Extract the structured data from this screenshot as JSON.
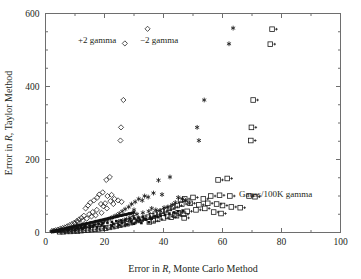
{
  "chart_data": {
    "type": "scatter",
    "title": "",
    "xlabel": "Error in R, Monte Carlo Method",
    "ylabel": "Error in R, Taylor Method",
    "xlabel_parts": {
      "pre": "Error in ",
      "italic": "R",
      "post": ", Monte Carlo Method"
    },
    "ylabel_parts": {
      "pre": "Error in ",
      "italic": "R",
      "post": ", Taylor Method"
    },
    "xlim": [
      0,
      100
    ],
    "ylim": [
      0,
      600
    ],
    "xticks": [
      0,
      20,
      40,
      60,
      80,
      100
    ],
    "yticks": [
      0,
      200,
      400,
      600
    ],
    "xticklabels": [
      "0",
      "20",
      "40",
      "60",
      "80",
      "100"
    ],
    "yticklabels": [
      "0",
      "200",
      "400",
      "600"
    ],
    "x_minor_step": 10,
    "y_minor_step": 50,
    "grid": false,
    "legend_position": "in-plot annotations",
    "annotations": [
      {
        "text": "+2 gamma",
        "x": 17.5,
        "y": 520,
        "marker": "diamond"
      },
      {
        "text": "−2 gamma",
        "x": 38.5,
        "y": 520,
        "marker": "asterisk"
      },
      {
        "text": "Gauss/100K gamma",
        "x": 78,
        "y": 97,
        "marker": "square-plus"
      }
    ],
    "series": [
      {
        "name": "+2 gamma",
        "marker": "diamond",
        "points": [
          [
            34.6,
            558
          ],
          [
            26.9,
            518
          ],
          [
            26.4,
            363
          ],
          [
            25.6,
            288
          ],
          [
            25.4,
            252
          ],
          [
            21.8,
            152
          ],
          [
            20.6,
            144
          ],
          [
            19.4,
            110
          ],
          [
            18.2,
            104
          ],
          [
            17.6,
            96
          ],
          [
            21.0,
            100
          ],
          [
            22.4,
            103
          ],
          [
            16.4,
            88
          ],
          [
            15.2,
            82
          ],
          [
            14.4,
            74
          ],
          [
            13.6,
            66
          ],
          [
            19.6,
            72
          ],
          [
            17.4,
            62
          ],
          [
            16.0,
            56
          ],
          [
            14.8,
            50
          ],
          [
            23.4,
            92
          ],
          [
            24.6,
            88
          ],
          [
            25.8,
            84
          ],
          [
            20.2,
            80
          ],
          [
            18.8,
            78
          ],
          [
            13.0,
            46
          ],
          [
            12.2,
            40
          ],
          [
            11.4,
            36
          ],
          [
            10.6,
            31
          ],
          [
            9.8,
            27
          ],
          [
            9.0,
            23
          ],
          [
            8.2,
            20
          ],
          [
            7.4,
            17
          ],
          [
            6.6,
            14
          ],
          [
            5.8,
            12
          ],
          [
            5.0,
            10
          ],
          [
            4.2,
            8
          ],
          [
            3.4,
            6
          ],
          [
            2.8,
            5
          ],
          [
            2.2,
            4
          ],
          [
            22.0,
            86
          ],
          [
            23.0,
            78
          ],
          [
            20.8,
            66
          ],
          [
            19.0,
            54
          ],
          [
            17.0,
            47
          ],
          [
            15.6,
            44
          ],
          [
            14.0,
            38
          ],
          [
            12.6,
            33
          ],
          [
            11.0,
            29
          ],
          [
            10.0,
            25
          ]
        ]
      },
      {
        "name": "−2 gamma",
        "marker": "asterisk",
        "points": [
          [
            63.6,
            560
          ],
          [
            62.2,
            517
          ],
          [
            53.8,
            363
          ],
          [
            51.4,
            288
          ],
          [
            52.0,
            252
          ],
          [
            38.3,
            143
          ],
          [
            42.2,
            152
          ],
          [
            36.6,
            108
          ],
          [
            39.5,
            104
          ],
          [
            33.6,
            100
          ],
          [
            34.8,
            97
          ],
          [
            31.6,
            92
          ],
          [
            32.8,
            88
          ],
          [
            30.4,
            84
          ],
          [
            29.2,
            78
          ],
          [
            45.0,
            96
          ],
          [
            46.4,
            92
          ],
          [
            44.0,
            82
          ],
          [
            43.0,
            76
          ],
          [
            41.5,
            70
          ],
          [
            28.2,
            70
          ],
          [
            27.0,
            64
          ],
          [
            26.0,
            58
          ],
          [
            25.0,
            52
          ],
          [
            24.0,
            47
          ],
          [
            36.0,
            66
          ],
          [
            37.4,
            62
          ],
          [
            35.0,
            58
          ],
          [
            33.0,
            54
          ],
          [
            31.0,
            50
          ],
          [
            23.0,
            43
          ],
          [
            22.0,
            39
          ],
          [
            21.0,
            35
          ],
          [
            20.0,
            31
          ],
          [
            19.0,
            28
          ],
          [
            18.0,
            25
          ],
          [
            17.0,
            22
          ],
          [
            16.0,
            19
          ],
          [
            15.0,
            17
          ],
          [
            14.0,
            15
          ],
          [
            13.0,
            13
          ],
          [
            12.0,
            11
          ],
          [
            11.0,
            9
          ],
          [
            10.0,
            8
          ],
          [
            9.0,
            7
          ],
          [
            8.0,
            6
          ],
          [
            7.0,
            5
          ],
          [
            6.0,
            4
          ],
          [
            5.0,
            3
          ],
          [
            4.0,
            3
          ],
          [
            29.8,
            45
          ],
          [
            28.6,
            41
          ],
          [
            27.4,
            37
          ],
          [
            26.2,
            33
          ],
          [
            24.8,
            30
          ],
          [
            47.5,
            88
          ],
          [
            48.8,
            80
          ],
          [
            40.2,
            68
          ],
          [
            38.8,
            60
          ],
          [
            30.0,
            62
          ]
        ]
      },
      {
        "name": "Gauss/100K gamma",
        "marker": "square-plus",
        "points": [
          [
            76.8,
            557
          ],
          [
            76.2,
            516
          ],
          [
            70.4,
            363
          ],
          [
            69.8,
            288
          ],
          [
            69.6,
            252
          ],
          [
            58.5,
            144
          ],
          [
            61.6,
            148
          ],
          [
            56.0,
            100
          ],
          [
            59.0,
            102
          ],
          [
            62.5,
            100
          ],
          [
            69.0,
            100
          ],
          [
            71.0,
            98
          ],
          [
            53.5,
            92
          ],
          [
            50.0,
            96
          ],
          [
            47.2,
            92
          ],
          [
            45.8,
            88
          ],
          [
            55.0,
            80
          ],
          [
            58.0,
            78
          ],
          [
            52.0,
            76
          ],
          [
            49.0,
            80
          ],
          [
            46.2,
            78
          ],
          [
            44.6,
            74
          ],
          [
            60.0,
            74
          ],
          [
            63.0,
            70
          ],
          [
            66.0,
            68
          ],
          [
            43.2,
            70
          ],
          [
            42.0,
            66
          ],
          [
            40.8,
            62
          ],
          [
            54.0,
            66
          ],
          [
            51.0,
            62
          ],
          [
            48.0,
            58
          ],
          [
            45.0,
            54
          ],
          [
            57.0,
            56
          ],
          [
            59.5,
            52
          ],
          [
            47.0,
            40
          ],
          [
            39.6,
            58
          ],
          [
            38.4,
            54
          ],
          [
            37.2,
            50
          ],
          [
            36.0,
            46
          ],
          [
            34.8,
            42
          ],
          [
            33.6,
            39
          ],
          [
            32.4,
            36
          ],
          [
            31.2,
            33
          ],
          [
            30.0,
            30
          ],
          [
            28.8,
            27
          ],
          [
            27.6,
            24
          ],
          [
            26.4,
            22
          ],
          [
            25.2,
            20
          ],
          [
            24.0,
            18
          ],
          [
            22.8,
            16
          ],
          [
            21.6,
            14
          ],
          [
            20.4,
            12
          ],
          [
            19.2,
            11
          ],
          [
            18.0,
            10
          ],
          [
            16.8,
            9
          ],
          [
            15.6,
            8
          ],
          [
            14.4,
            7
          ],
          [
            13.2,
            6
          ],
          [
            12.0,
            5
          ],
          [
            10.8,
            4
          ],
          [
            9.6,
            4
          ],
          [
            8.4,
            3
          ],
          [
            7.2,
            3
          ],
          [
            6.0,
            2
          ],
          [
            4.8,
            2
          ],
          [
            41.4,
            44
          ],
          [
            40.0,
            40
          ],
          [
            38.0,
            36
          ],
          [
            36.5,
            32
          ],
          [
            35.2,
            29
          ],
          [
            43.8,
            48
          ],
          [
            42.6,
            42
          ],
          [
            44.4,
            46
          ],
          [
            46.8,
            50
          ]
        ]
      },
      {
        "name": "dense-core",
        "marker": "dot-cluster",
        "points": [
          [
            2.0,
            3
          ],
          [
            2.4,
            4
          ],
          [
            2.8,
            4
          ],
          [
            3.2,
            5
          ],
          [
            3.6,
            6
          ],
          [
            4.0,
            6
          ],
          [
            4.4,
            7
          ],
          [
            4.8,
            8
          ],
          [
            5.2,
            8
          ],
          [
            5.6,
            9
          ],
          [
            6.0,
            10
          ],
          [
            6.4,
            10
          ],
          [
            6.8,
            11
          ],
          [
            7.2,
            12
          ],
          [
            7.6,
            13
          ],
          [
            8.0,
            13
          ],
          [
            8.4,
            14
          ],
          [
            8.8,
            15
          ],
          [
            9.2,
            16
          ],
          [
            9.6,
            16
          ],
          [
            10.0,
            17
          ],
          [
            10.4,
            18
          ],
          [
            10.8,
            19
          ],
          [
            11.2,
            19
          ],
          [
            11.6,
            20
          ],
          [
            12.0,
            21
          ],
          [
            12.4,
            22
          ],
          [
            12.8,
            22
          ],
          [
            13.2,
            23
          ],
          [
            13.6,
            24
          ],
          [
            14.0,
            25
          ],
          [
            14.4,
            25
          ],
          [
            14.8,
            26
          ],
          [
            15.2,
            27
          ],
          [
            15.6,
            28
          ],
          [
            16.0,
            28
          ],
          [
            16.4,
            29
          ],
          [
            16.8,
            30
          ],
          [
            17.2,
            31
          ],
          [
            17.6,
            31
          ],
          [
            18.0,
            32
          ],
          [
            18.4,
            33
          ],
          [
            18.8,
            34
          ],
          [
            19.2,
            34
          ],
          [
            19.6,
            35
          ],
          [
            20.0,
            36
          ],
          [
            20.4,
            37
          ],
          [
            20.8,
            37
          ],
          [
            21.2,
            38
          ],
          [
            21.6,
            39
          ],
          [
            22.0,
            40
          ],
          [
            22.4,
            40
          ],
          [
            22.8,
            41
          ],
          [
            23.2,
            42
          ],
          [
            23.6,
            43
          ],
          [
            24.0,
            43
          ],
          [
            24.4,
            44
          ],
          [
            24.8,
            45
          ],
          [
            25.2,
            46
          ],
          [
            25.6,
            46
          ],
          [
            26.0,
            47
          ],
          [
            26.4,
            48
          ],
          [
            26.8,
            49
          ],
          [
            27.2,
            49
          ],
          [
            27.6,
            50
          ],
          [
            28.0,
            51
          ],
          [
            28.4,
            52
          ],
          [
            28.8,
            52
          ],
          [
            29.2,
            53
          ],
          [
            29.6,
            54
          ],
          [
            30.0,
            55
          ],
          [
            3.0,
            3
          ],
          [
            4.5,
            5
          ],
          [
            6.0,
            7
          ],
          [
            7.5,
            9
          ],
          [
            9.0,
            11
          ],
          [
            10.5,
            13
          ],
          [
            12.0,
            15
          ],
          [
            13.5,
            17
          ],
          [
            15.0,
            19
          ],
          [
            16.5,
            21
          ],
          [
            18.0,
            23
          ],
          [
            19.5,
            25
          ],
          [
            21.0,
            27
          ],
          [
            22.5,
            29
          ],
          [
            24.0,
            31
          ],
          [
            25.5,
            33
          ],
          [
            27.0,
            35
          ],
          [
            28.5,
            37
          ],
          [
            30.0,
            39
          ],
          [
            31.5,
            41
          ],
          [
            33.0,
            43
          ],
          [
            2.5,
            2
          ],
          [
            5.0,
            4
          ],
          [
            7.5,
            6
          ],
          [
            10.0,
            8
          ],
          [
            12.5,
            10
          ],
          [
            15.0,
            12
          ],
          [
            17.5,
            14
          ],
          [
            20.0,
            16
          ],
          [
            22.5,
            18
          ],
          [
            25.0,
            20
          ],
          [
            27.5,
            22
          ],
          [
            30.0,
            24
          ],
          [
            32.5,
            26
          ],
          [
            35.0,
            28
          ],
          [
            3.5,
            4
          ],
          [
            5.5,
            6
          ],
          [
            8.0,
            9
          ],
          [
            11.0,
            12
          ],
          [
            13.0,
            14
          ],
          [
            16.0,
            17
          ],
          [
            19.0,
            20
          ],
          [
            23.0,
            24
          ],
          [
            26.0,
            27
          ],
          [
            29.0,
            30
          ],
          [
            31.0,
            33
          ],
          [
            34.0,
            36
          ],
          [
            36.0,
            38
          ],
          [
            38.0,
            42
          ],
          [
            32.0,
            35
          ],
          [
            33.5,
            38
          ],
          [
            35.5,
            41
          ],
          [
            37.0,
            44
          ],
          [
            39.0,
            46
          ],
          [
            40.5,
            48
          ],
          [
            42.0,
            52
          ],
          [
            43.5,
            55
          ],
          [
            45.0,
            58
          ],
          [
            46.5,
            60
          ]
        ]
      }
    ]
  }
}
